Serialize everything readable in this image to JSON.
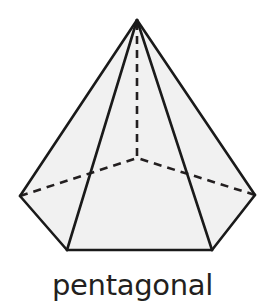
{
  "figure": {
    "caption": "pentagonal",
    "shape_name": "pentagonal pyramid",
    "background_color": "#ffffff",
    "face_fill_color": "#f1f1f1",
    "edge_color": "#1a1a1a",
    "hidden_edge_color": "#231f20",
    "caption_color": "#231f20",
    "edge_width": 2.6,
    "hidden_edge_width": 2.6,
    "hidden_edge_dash": "8 6",
    "vertices": {
      "apex": [
        137,
        20
      ],
      "left": [
        20,
        196
      ],
      "right": [
        255,
        195
      ],
      "bottom_left": [
        67,
        250
      ],
      "bottom_right": [
        212,
        250
      ],
      "back_hidden": [
        137,
        158
      ]
    },
    "visible_faces": [
      {
        "name": "face-left",
        "points": "137,20 20,196 67,250"
      },
      {
        "name": "face-front-left",
        "points": "137,20 67,250 212,250"
      },
      {
        "name": "face-right",
        "points": "137,20 212,250 255,195"
      }
    ],
    "visible_edges": [
      {
        "name": "edge-apex-to-left",
        "from": "apex",
        "to": "left"
      },
      {
        "name": "edge-apex-to-bottom-left",
        "from": "apex",
        "to": "bottom_left"
      },
      {
        "name": "edge-apex-to-bottom-right",
        "from": "apex",
        "to": "bottom_right"
      },
      {
        "name": "edge-apex-to-right",
        "from": "apex",
        "to": "right"
      },
      {
        "name": "edge-left-to-bottom-left",
        "from": "left",
        "to": "bottom_left"
      },
      {
        "name": "edge-bottom-left-to-bottom-right",
        "from": "bottom_left",
        "to": "bottom_right"
      },
      {
        "name": "edge-bottom-right-to-right",
        "from": "bottom_right",
        "to": "right"
      }
    ],
    "hidden_edges": [
      {
        "name": "hidden-edge-left-to-back",
        "from": "left",
        "to": "back_hidden"
      },
      {
        "name": "hidden-edge-right-to-back",
        "from": "right",
        "to": "back_hidden"
      },
      {
        "name": "hidden-altitude-apex-to-back",
        "from": "apex",
        "to": "back_hidden"
      }
    ]
  }
}
